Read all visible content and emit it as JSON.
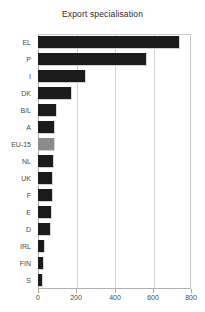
{
  "chart_data": {
    "type": "bar",
    "orientation": "horizontal",
    "title": "Export specialisation",
    "xlabel": "",
    "ylabel": "",
    "categories": [
      "EL",
      "P",
      "I",
      "DK",
      "B/L",
      "A",
      "EU-15",
      "NL",
      "UK",
      "F",
      "E",
      "D",
      "IRL",
      "FIN",
      "S"
    ],
    "values": [
      743,
      570,
      251,
      178,
      99,
      89,
      89,
      84,
      78,
      76,
      74,
      66,
      37,
      31,
      26
    ],
    "xticks": [
      "0",
      "200",
      "400",
      "600",
      "800"
    ],
    "xtick_values": [
      0,
      200,
      400,
      600,
      800
    ],
    "xlim": [
      0,
      800
    ],
    "grid": true,
    "legend": "none",
    "highlight_category": "EU-15",
    "colors": {
      "bar": "#1b1b1b",
      "highlight": "#8c8c8c",
      "grid": "#d2d2d2",
      "axis": "#b0b0b0",
      "text": "#4a4a4a",
      "title": "#2a2a2a",
      "background": "#ffffff"
    }
  }
}
